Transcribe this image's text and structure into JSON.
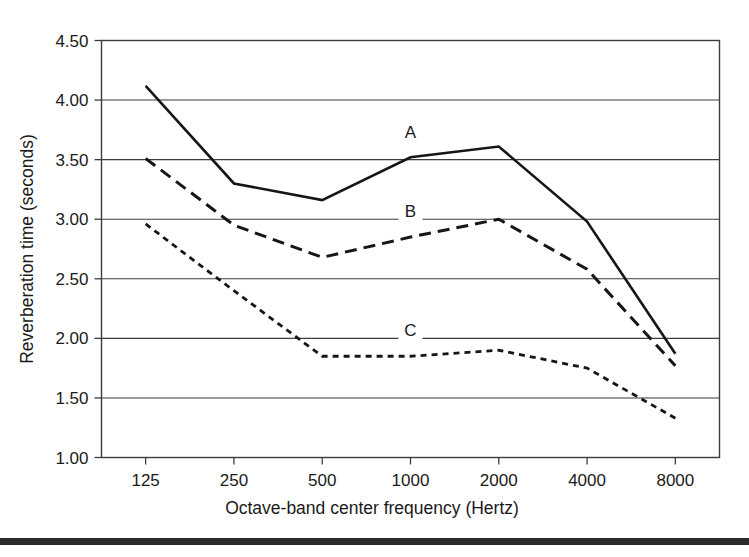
{
  "chart_data": {
    "type": "line",
    "title": "",
    "xlabel": "Octave-band center frequency (Hertz)",
    "ylabel": "Reverberation time (seconds)",
    "categories": [
      "125",
      "250",
      "500",
      "1000",
      "2000",
      "4000",
      "8000"
    ],
    "x_tick_labels": [
      "125",
      "250",
      "500",
      "1000",
      "2000",
      "4000",
      "8000"
    ],
    "y_tick_labels": [
      "4.50",
      "4.00",
      "3.50",
      "3.00",
      "2.50",
      "2.00",
      "1.50",
      "1.00"
    ],
    "y_tick_values": [
      4.5,
      4.0,
      3.5,
      3.0,
      2.5,
      2.0,
      1.5,
      1.0
    ],
    "ylim": [
      1.0,
      4.5
    ],
    "grid": "horizontal",
    "legend_position": "inline-annotations",
    "series": [
      {
        "name": "A",
        "label": "A",
        "style": "solid",
        "color": "#161616",
        "values": [
          4.12,
          3.3,
          3.16,
          3.52,
          3.61,
          2.98,
          1.87
        ],
        "label_x_category": "1000",
        "label_value": 3.68
      },
      {
        "name": "B",
        "label": "B",
        "style": "dashed",
        "color": "#161616",
        "values": [
          3.51,
          2.95,
          2.68,
          2.85,
          3.0,
          2.58,
          1.77
        ],
        "label_x_category": "1000",
        "label_value": 3.02
      },
      {
        "name": "C",
        "label": "C",
        "style": "dotted",
        "color": "#161616",
        "values": [
          2.96,
          2.4,
          1.85,
          1.85,
          1.9,
          1.75,
          1.33
        ],
        "label_x_category": "1000",
        "label_value": 2.02
      }
    ]
  },
  "figure": {
    "background_color": "#ffffff",
    "axis_color": "#3c3c3c",
    "bottom_rule_color": "#2b2b2b"
  }
}
